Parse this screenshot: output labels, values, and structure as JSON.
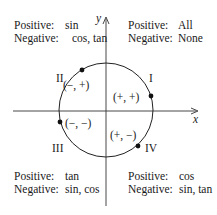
{
  "diagram": {
    "title": "",
    "axes": {
      "x_label": "x",
      "y_label": "y"
    },
    "quadrants": [
      {
        "numeral": "I",
        "sign_pair": "(+, +)",
        "positive_label": "Positive:",
        "positive": "All",
        "negative_label": "Negative:",
        "negative": "None"
      },
      {
        "numeral": "II",
        "sign_pair": "(−, +)",
        "positive_label": "Positive:",
        "positive": "sin",
        "negative_label": "Negative:",
        "negative": "cos, tan"
      },
      {
        "numeral": "III",
        "sign_pair": "(−, −)",
        "positive_label": "Positive:",
        "positive": "tan",
        "negative_label": "Negative:",
        "negative": "sin, cos"
      },
      {
        "numeral": "IV",
        "sign_pair": "(+, −)",
        "positive_label": "Positive:",
        "positive": "cos",
        "negative_label": "Negative:",
        "negative": "sin, tan"
      }
    ],
    "colors": {
      "ink": "#1a1a1a",
      "background": "#ffffff"
    }
  }
}
